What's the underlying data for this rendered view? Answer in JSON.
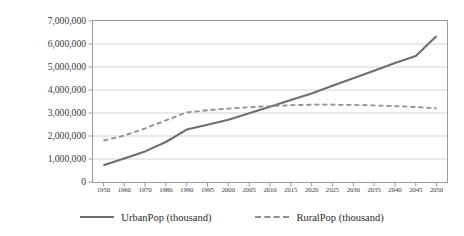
{
  "chart_data": {
    "type": "line",
    "title": "",
    "xlabel": "",
    "ylabel": "Population (millions)",
    "grid": true,
    "legend_position": "bottom",
    "ylim": [
      0,
      7000000
    ],
    "ytick_values": [
      0,
      1000000,
      2000000,
      3000000,
      4000000,
      5000000,
      6000000,
      7000000
    ],
    "ytick_labels": [
      "0",
      "1,000,000",
      "2,000,000",
      "3,000,000",
      "4,000,000",
      "5,000,000",
      "6,000,000",
      "7,000,000"
    ],
    "categories": [
      "1950",
      "1960",
      "1970",
      "1980",
      "1990",
      "1995",
      "2000",
      "2005",
      "2010",
      "2015",
      "2020",
      "2025",
      "2030",
      "2035",
      "2040",
      "2045",
      "2050"
    ],
    "series": [
      {
        "name": "UrbanPop (thousand)",
        "style": "solid",
        "color": "#6e6e6e",
        "values": [
          730000,
          1020000,
          1330000,
          1740000,
          2280000,
          2490000,
          2710000,
          2990000,
          3270000,
          3560000,
          3850000,
          4180000,
          4510000,
          4840000,
          5170000,
          5480000,
          6350000
        ]
      },
      {
        "name": "RuralPop (thousand)",
        "style": "dashed",
        "color": "#8f8f8f",
        "values": [
          1800000,
          2020000,
          2330000,
          2680000,
          3030000,
          3120000,
          3190000,
          3250000,
          3300000,
          3340000,
          3360000,
          3360000,
          3350000,
          3330000,
          3300000,
          3260000,
          3200000
        ]
      }
    ]
  },
  "legend": {
    "items": [
      {
        "label": "UrbanPop (thousand)",
        "style": "solid"
      },
      {
        "label": "RuralPop (thousand)",
        "style": "dashed"
      }
    ]
  },
  "axis": {
    "y_title": "Population (millions)"
  }
}
